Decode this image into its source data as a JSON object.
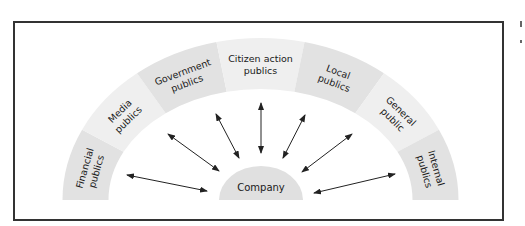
{
  "diagram": {
    "center": {
      "label": "Company",
      "fill": "#e0e0e0"
    },
    "colors": {
      "dark_segment": "#e2e2e2",
      "light_segment": "#efefef",
      "arrow": "#222222",
      "border": "#333333"
    },
    "publics": [
      {
        "id": "financial",
        "line1": "Financial",
        "line2": "publics",
        "shade": "dark"
      },
      {
        "id": "media",
        "line1": "Media",
        "line2": "publics",
        "shade": "light"
      },
      {
        "id": "government",
        "line1": "Government",
        "line2": "publics",
        "shade": "dark"
      },
      {
        "id": "citizen-action",
        "line1": "Citizen action",
        "line2": "publics",
        "shade": "light"
      },
      {
        "id": "local",
        "line1": "Local",
        "line2": "publics",
        "shade": "dark"
      },
      {
        "id": "general",
        "line1": "General",
        "line2": "public",
        "shade": "light"
      },
      {
        "id": "internal",
        "line1": "Internal",
        "line2": "publics",
        "shade": "dark"
      }
    ],
    "arrows": [
      {
        "to": "financial",
        "x1": 127,
        "y1": 175,
        "x2": 207,
        "y2": 191
      },
      {
        "to": "media",
        "x1": 168,
        "y1": 134,
        "x2": 219,
        "y2": 171
      },
      {
        "to": "government",
        "x1": 216,
        "y1": 114,
        "x2": 239,
        "y2": 158
      },
      {
        "to": "citizen-action",
        "x1": 261,
        "y1": 103,
        "x2": 261,
        "y2": 153
      },
      {
        "to": "local",
        "x1": 305,
        "y1": 115,
        "x2": 283,
        "y2": 158
      },
      {
        "to": "general",
        "x1": 352,
        "y1": 134,
        "x2": 302,
        "y2": 172
      },
      {
        "to": "internal",
        "x1": 395,
        "y1": 174,
        "x2": 314,
        "y2": 193
      }
    ]
  }
}
